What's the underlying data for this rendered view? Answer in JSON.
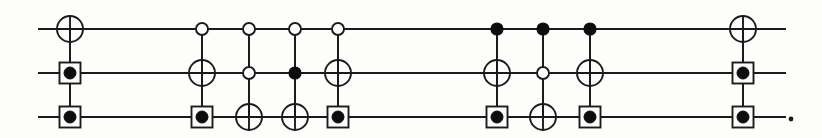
{
  "figure": {
    "width": 822,
    "height": 138,
    "background_color": "#fdfdfc",
    "ink_color": "#1b1b1b",
    "trailing_punctuation": "."
  },
  "wires": [
    {
      "index": 0,
      "name": "top-wire",
      "y": 29,
      "x_start": 38,
      "x_end": 786
    },
    {
      "index": 1,
      "name": "middle-wire",
      "y": 73,
      "x_start": 38,
      "x_end": 786
    },
    {
      "index": 2,
      "name": "bottom-wire",
      "y": 117,
      "x_start": 38,
      "x_end": 786
    }
  ],
  "symbol_geometry": {
    "xor_radius": 13,
    "open_dot_radius": 6,
    "filled_dot_radius": 6,
    "boxed_dot_box_size": 21,
    "boxed_dot_inner_radius": 6
  },
  "symbol_legend": [
    {
      "key": "xor",
      "label": "target (XOR / NOT)"
    },
    {
      "key": "open_dot",
      "label": "control on 0 (open)"
    },
    {
      "key": "filled_dot",
      "label": "control on 1 (filled)"
    },
    {
      "key": "boxed_dot",
      "label": "boxed control"
    },
    {
      "key": "none",
      "label": "no gate on wire"
    }
  ],
  "columns": [
    {
      "index": 1,
      "name": "gate-column-1",
      "x": 70,
      "span": {
        "top_y": 29,
        "bottom_y": 117
      },
      "symbols": [
        "xor",
        "boxed_dot",
        "boxed_dot"
      ]
    },
    {
      "index": 2,
      "name": "gate-column-2",
      "x": 202,
      "span": {
        "top_y": 29,
        "bottom_y": 117
      },
      "symbols": [
        "open_dot",
        "xor",
        "boxed_dot"
      ]
    },
    {
      "index": 3,
      "name": "gate-column-3",
      "x": 249,
      "span": {
        "top_y": 29,
        "bottom_y": 117
      },
      "symbols": [
        "open_dot",
        "open_dot",
        "xor"
      ]
    },
    {
      "index": 4,
      "name": "gate-column-4",
      "x": 295,
      "span": {
        "top_y": 29,
        "bottom_y": 117
      },
      "symbols": [
        "open_dot",
        "filled_dot",
        "xor"
      ]
    },
    {
      "index": 5,
      "name": "gate-column-5",
      "x": 338,
      "span": {
        "top_y": 29,
        "bottom_y": 117
      },
      "symbols": [
        "open_dot",
        "xor",
        "boxed_dot"
      ]
    },
    {
      "index": 6,
      "name": "gate-column-6",
      "x": 497,
      "span": {
        "top_y": 29,
        "bottom_y": 117
      },
      "symbols": [
        "filled_dot",
        "xor",
        "boxed_dot"
      ]
    },
    {
      "index": 7,
      "name": "gate-column-7",
      "x": 543,
      "span": {
        "top_y": 29,
        "bottom_y": 117
      },
      "symbols": [
        "filled_dot",
        "open_dot",
        "xor"
      ]
    },
    {
      "index": 8,
      "name": "gate-column-8",
      "x": 590,
      "span": {
        "top_y": 29,
        "bottom_y": 117
      },
      "symbols": [
        "filled_dot",
        "xor",
        "boxed_dot"
      ]
    },
    {
      "index": 9,
      "name": "gate-column-9",
      "x": 743,
      "span": {
        "top_y": 29,
        "bottom_y": 117
      },
      "symbols": [
        "xor",
        "boxed_dot",
        "boxed_dot"
      ]
    }
  ],
  "period": {
    "x": 791,
    "y": 119,
    "radius": 2.4
  }
}
